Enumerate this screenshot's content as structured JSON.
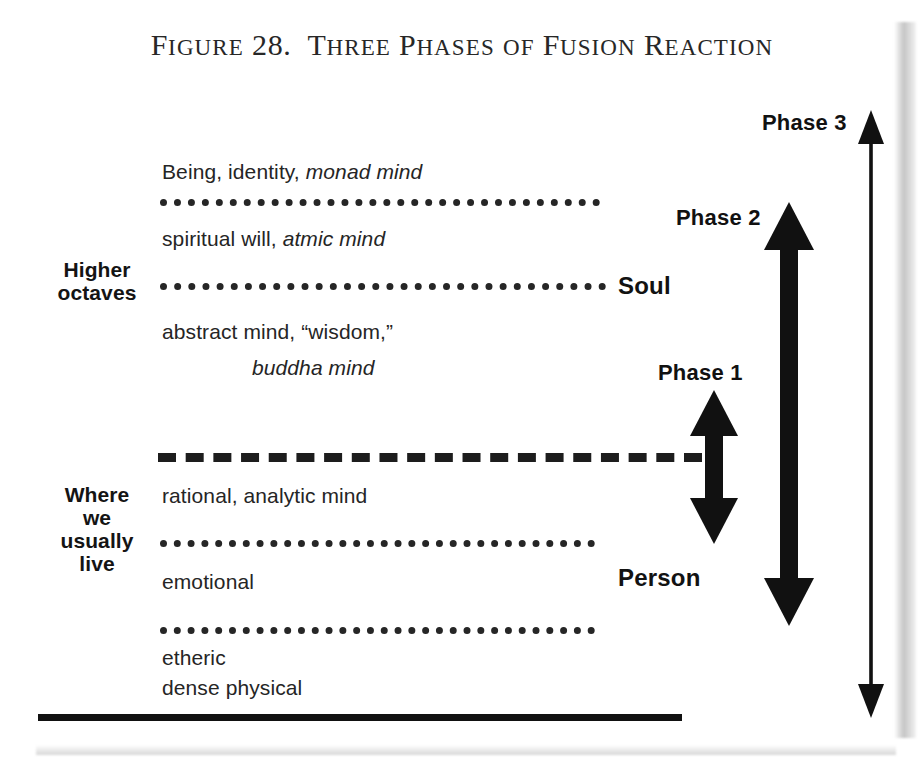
{
  "figure": {
    "title_prefix": "Figure 28.",
    "title_main": "Three Phases of Fusion Reaction",
    "title_full": "Figure 28.  Three Phases of Fusion Reaction"
  },
  "groups": {
    "higher": "Higher\noctaves",
    "higher_line1": "Higher",
    "higher_line2": "octaves",
    "lower_line1": "Where",
    "lower_line2": "we",
    "lower_line3": "usually",
    "lower_line4": "live"
  },
  "bands": {
    "monad_plain": "Being, identity,",
    "monad_italic": "monad mind",
    "atmic_plain": "spiritual will,",
    "atmic_italic": "atmic mind",
    "buddhi_plain": "abstract mind, “wisdom,”",
    "buddhi_italic": "buddha mind",
    "rational": "rational, analytic mind",
    "emotional": "emotional",
    "etheric": "etheric",
    "dense_physical": "dense physical"
  },
  "side_labels": {
    "soul": "Soul",
    "person": "Person"
  },
  "phases": {
    "phase1": "Phase 1",
    "phase2": "Phase 2",
    "phase3": "Phase 3"
  },
  "colors": {
    "ink": "#1a1a1a",
    "rule": "#262626",
    "arrow": "#111111",
    "background": "#ffffff"
  }
}
